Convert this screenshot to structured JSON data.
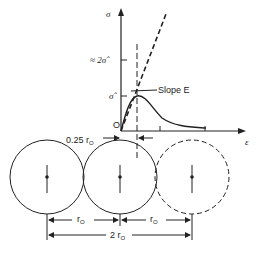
{
  "figure": {
    "axes": {
      "y_label": "σ",
      "x_label": "ε",
      "origin_label": "O"
    },
    "y_ticks": [
      {
        "label": "≈ 2σ̂",
        "position": "upper"
      },
      {
        "label": "σ̂",
        "position": "peak"
      }
    ],
    "annotations": {
      "slope": "Slope E",
      "offset": "0.25 r",
      "offset_sub": "O"
    },
    "dimensions": {
      "r0_left": "r",
      "r0_left_sub": "O",
      "r0_right": "r",
      "r0_right_sub": "O",
      "two_r0": "2 r",
      "two_r0_sub": "O"
    },
    "atoms": [
      {
        "style": "solid"
      },
      {
        "style": "solid"
      },
      {
        "style": "dashed"
      }
    ],
    "colors": {
      "line": "#222222",
      "background": "#ffffff"
    }
  }
}
